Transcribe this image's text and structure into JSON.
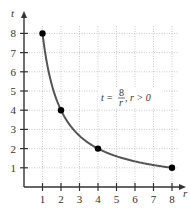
{
  "chart_data": {
    "type": "line",
    "title": "",
    "xlabel": "r",
    "ylabel": "t",
    "xlim": [
      0,
      8.6
    ],
    "ylim": [
      0,
      9.1
    ],
    "x_ticks": [
      "1",
      "2",
      "3",
      "4",
      "5",
      "6",
      "7",
      "8"
    ],
    "y_ticks": [
      "1",
      "2",
      "3",
      "4",
      "5",
      "6",
      "7",
      "8"
    ],
    "grid": true,
    "grid_style": "dotted",
    "series": [
      {
        "name": "t = 8/r, r > 0",
        "function": "t = 8/r",
        "x_range": [
          1,
          8
        ],
        "color": "#555555"
      }
    ],
    "points": [
      {
        "x": 1,
        "y": 8
      },
      {
        "x": 2,
        "y": 4
      },
      {
        "x": 4,
        "y": 2
      },
      {
        "x": 8,
        "y": 1
      }
    ],
    "annotation": {
      "lhs": "t =",
      "numerator": "8",
      "denominator": "r",
      "condition": ", r > 0",
      "position": {
        "x": 5.5,
        "y": 4.7
      }
    }
  },
  "colors": {
    "axis": "#333333",
    "curve": "#555555",
    "grid": "#bbbbbb",
    "points": "#000000"
  }
}
